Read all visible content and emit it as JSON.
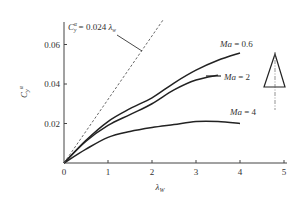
{
  "chart_data": {
    "type": "line",
    "title": "",
    "xlabel": "λw",
    "ylabel": "Cyα",
    "xlim": [
      0,
      5
    ],
    "ylim": [
      0,
      0.072
    ],
    "grid": false,
    "legend": "inline annotations",
    "x_ticks": [
      "0",
      "1",
      "2",
      "3",
      "4",
      "5"
    ],
    "y_ticks": [
      "0.02",
      "0.04",
      "0.06"
    ],
    "series": [
      {
        "name": "Ma = 0.6",
        "style": "solid",
        "x": [
          0,
          0.5,
          1,
          1.5,
          2,
          2.5,
          3,
          3.5,
          4
        ],
        "values": [
          0,
          0.0115,
          0.021,
          0.0275,
          0.033,
          0.0405,
          0.047,
          0.052,
          0.0557
        ]
      },
      {
        "name": "Ma = 2",
        "style": "solid",
        "x": [
          0,
          0.5,
          1,
          1.5,
          2,
          2.5,
          3,
          3.5
        ],
        "values": [
          0,
          0.011,
          0.019,
          0.0245,
          0.03,
          0.037,
          0.042,
          0.0445
        ]
      },
      {
        "name": "Ma = 4",
        "style": "solid",
        "x": [
          0,
          0.5,
          1,
          1.5,
          2,
          2.5,
          3,
          3.5,
          4
        ],
        "values": [
          0,
          0.007,
          0.013,
          0.016,
          0.018,
          0.0195,
          0.021,
          0.021,
          0.02
        ]
      },
      {
        "name": "Cyα = 0.024 λw",
        "style": "dashed",
        "x": [
          0,
          2.25
        ],
        "values": [
          0,
          0.0724
        ]
      }
    ],
    "annotations": [
      {
        "text": "Ma = 0.6",
        "at": [
          3.6,
          0.059
        ]
      },
      {
        "text": "Ma = 2",
        "at": [
          4.0,
          0.044
        ]
      },
      {
        "text": "Ma = 4",
        "at": [
          3.8,
          0.025
        ]
      },
      {
        "text": "Cyα = 0.024 λw",
        "at": [
          0.3,
          0.068
        ]
      }
    ],
    "inset_icon": "delta-wing planform triangle with centerline"
  },
  "labels": {
    "y_axis": {
      "main": "C",
      "sub": "y",
      "sup": "α"
    },
    "x_axis": {
      "main": "λ",
      "sub": "W"
    },
    "formula": {
      "c": "C",
      "sub": "y",
      "sup": "α",
      "rest": " = 0.024 ",
      "lambda": "λ",
      "lsub": "w"
    },
    "ma06": {
      "ma": "Ma",
      "val": " = 0.6"
    },
    "ma2": {
      "ma": "Ma",
      "val": " = 2"
    },
    "ma4": {
      "ma": "Ma",
      "val": " = 4"
    }
  },
  "colors": {
    "axis": "#444444",
    "curve": "#222222",
    "dashed": "#555555"
  }
}
